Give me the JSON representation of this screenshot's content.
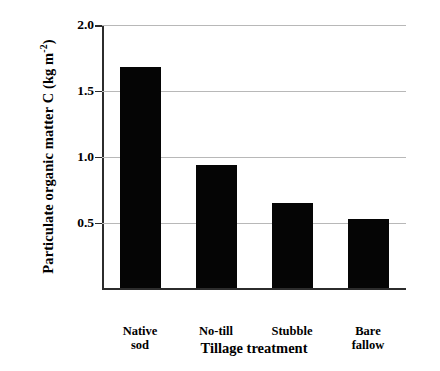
{
  "chart_data": {
    "type": "bar",
    "title": "",
    "subtitle": "",
    "xlabel": "Tillage treatment",
    "ylabel": "Particulate organic matter C (kg m-2)",
    "ylabel_parts": {
      "main": "Particulate organic matter C (kg m",
      "exponent": "-2",
      "tail": ")"
    },
    "categories": [
      "Native sod",
      "No-till",
      "Stubble",
      "Bare fallow"
    ],
    "category_lines": [
      [
        "Native",
        "sod"
      ],
      [
        "No-till",
        ""
      ],
      [
        "Stubble",
        ""
      ],
      [
        "Bare",
        "fallow"
      ]
    ],
    "values": [
      1.68,
      0.94,
      0.65,
      0.53
    ],
    "ylim": [
      0,
      2.0
    ],
    "xlim": [
      0,
      4
    ],
    "yticks": [
      0.5,
      1.0,
      1.5,
      2.0
    ],
    "ytick_labels": [
      "0.5",
      "1.0",
      "1.5",
      "2.0"
    ],
    "grid": true,
    "grid_axis": "y",
    "grid_color": "#b8b8b8",
    "legend": null,
    "legend_position": "none",
    "bar_color": "#050505",
    "axis_color": "#2c2c2c",
    "background_color": "#ffffff",
    "annotations": []
  }
}
